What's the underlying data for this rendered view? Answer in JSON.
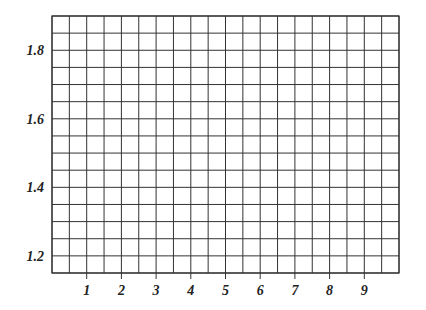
{
  "chart_data": {
    "type": "line",
    "title": "",
    "xlabel": "",
    "ylabel": "",
    "xlim": [
      0,
      10
    ],
    "ylim": [
      1.15,
      1.9
    ],
    "x_ticks": [
      1,
      2,
      3,
      4,
      5,
      6,
      7,
      8,
      9
    ],
    "x_tick_labels": [
      "1",
      "2",
      "3",
      "4",
      "5",
      "6",
      "7",
      "8",
      "9"
    ],
    "y_ticks": [
      1.2,
      1.4,
      1.6,
      1.8
    ],
    "y_tick_labels": [
      "1.2",
      "1.4",
      "1.6",
      "1.8"
    ],
    "grid": true,
    "grid_x_step": 0.5,
    "grid_y_step": 0.05,
    "grid_columns": 20,
    "grid_rows": 15,
    "series": [],
    "legend": null
  },
  "colors": {
    "grid_line": "#333333",
    "text": "#222222",
    "background": "#ffffff"
  }
}
